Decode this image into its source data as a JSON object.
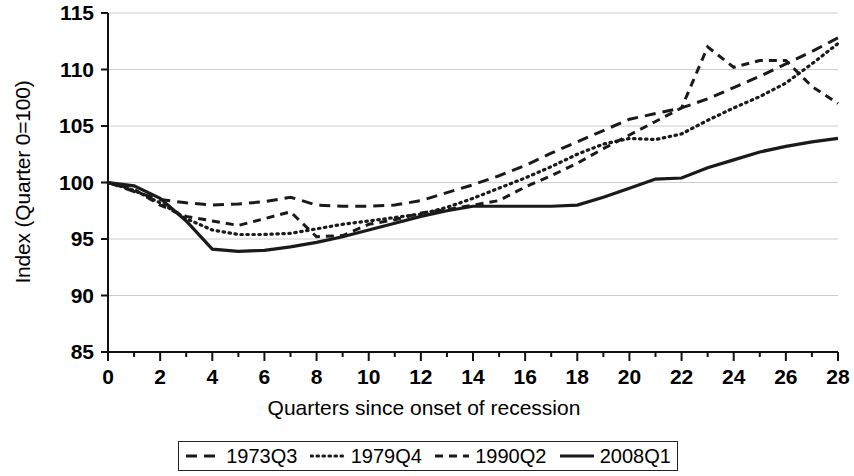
{
  "chart_data": {
    "type": "line",
    "title": "",
    "xlabel": "Quarters since onset of recession",
    "ylabel": "Index (Quarter 0=100)",
    "xlim": [
      0,
      28
    ],
    "ylim": [
      85,
      115
    ],
    "xticks": [
      0,
      2,
      4,
      6,
      8,
      10,
      12,
      14,
      16,
      18,
      20,
      22,
      24,
      26,
      28
    ],
    "xtick_labels": [
      "0",
      "2",
      "4",
      "6",
      "8",
      "10",
      "12",
      "14",
      "16",
      "18",
      "20",
      "22",
      "24",
      "26",
      "28"
    ],
    "yticks": [
      85,
      90,
      95,
      100,
      105,
      110,
      115
    ],
    "ytick_labels": [
      "85",
      "90",
      "95",
      "100",
      "105",
      "110",
      "115"
    ],
    "minor_xtick_interval": 1,
    "grid": "horizontal",
    "grid_color": "#cccccc",
    "legend_position": "bottom",
    "x": [
      0,
      1,
      2,
      3,
      4,
      5,
      6,
      7,
      8,
      9,
      10,
      11,
      12,
      13,
      14,
      15,
      16,
      17,
      18,
      19,
      20,
      21,
      22,
      23,
      24,
      25,
      26,
      27,
      28
    ],
    "series": [
      {
        "name": "1973Q3",
        "style": "dashed",
        "color": "#1a1a1a",
        "dasharray": "11,7",
        "width": 3,
        "values": [
          100.0,
          99.2,
          98.5,
          98.2,
          98.0,
          98.1,
          98.3,
          98.7,
          98.0,
          97.9,
          97.9,
          98.0,
          98.4,
          99.1,
          99.8,
          100.6,
          101.5,
          102.6,
          103.6,
          104.6,
          105.6,
          106.1,
          106.6,
          107.4,
          108.4,
          109.4,
          110.5,
          111.6,
          112.8
        ]
      },
      {
        "name": "1979Q4",
        "style": "dotted",
        "color": "#1a1a1a",
        "dasharray": "1.5,4.5",
        "width": 3.2,
        "values": [
          100.0,
          99.3,
          98.2,
          96.8,
          95.8,
          95.4,
          95.4,
          95.5,
          95.9,
          96.3,
          96.6,
          96.9,
          97.2,
          97.8,
          98.6,
          99.5,
          100.4,
          101.4,
          102.5,
          103.4,
          103.9,
          103.8,
          104.3,
          105.5,
          106.6,
          107.6,
          108.8,
          110.5,
          112.3
        ]
      },
      {
        "name": "1990Q2",
        "style": "dash-short",
        "color": "#1a1a1a",
        "dasharray": "8,6",
        "width": 3,
        "values": [
          100.0,
          99.4,
          98.0,
          97.0,
          96.6,
          96.2,
          96.8,
          97.4,
          95.2,
          95.3,
          96.3,
          96.7,
          97.3,
          97.6,
          98.0,
          98.4,
          99.6,
          100.6,
          101.7,
          103.0,
          104.2,
          105.4,
          106.6,
          112.0,
          110.2,
          110.8,
          110.8,
          108.5,
          107.0
        ]
      },
      {
        "name": "2008Q1",
        "style": "solid",
        "color": "#1a1a1a",
        "dasharray": "",
        "width": 3.2,
        "values": [
          100.0,
          99.7,
          98.6,
          96.6,
          94.1,
          93.9,
          94.0,
          94.3,
          94.7,
          95.2,
          95.8,
          96.4,
          97.0,
          97.5,
          97.9,
          97.9,
          97.9,
          97.9,
          98.0,
          98.7,
          99.5,
          100.3,
          100.4,
          101.3,
          102.0,
          102.7,
          103.2,
          103.6,
          103.9
        ]
      }
    ]
  },
  "axis": {
    "y_title": "Index (Quarter 0=100)",
    "x_title": "Quarters since onset of recession"
  },
  "legend": {
    "items": [
      {
        "label": "1973Q3",
        "style": "dashed"
      },
      {
        "label": "1979Q4",
        "style": "dotted"
      },
      {
        "label": "1990Q2",
        "style": "dash-short"
      },
      {
        "label": "2008Q1",
        "style": "solid"
      }
    ]
  }
}
